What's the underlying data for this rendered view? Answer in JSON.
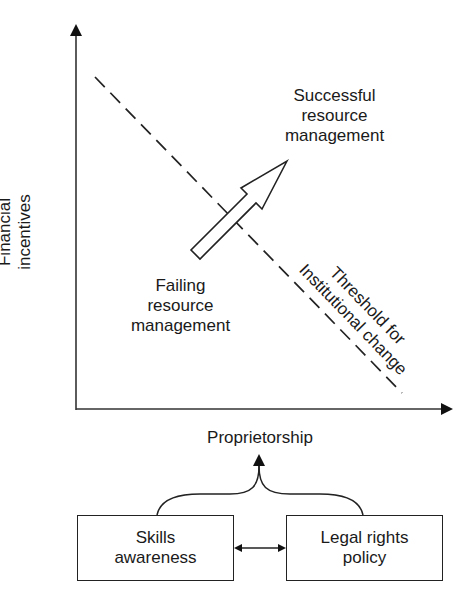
{
  "figure": {
    "y_axis_label": [
      "Financial",
      "incentives"
    ],
    "x_axis_label": "Proprietorship",
    "regions": {
      "upper": [
        "Successful",
        "resource",
        "management"
      ],
      "lower": [
        "Failing",
        "resource",
        "management"
      ]
    },
    "threshold_label": [
      "Threshold for",
      "Institutional change"
    ],
    "boxes": {
      "left": [
        "Skills",
        "awareness"
      ],
      "right": [
        "Legal rights",
        "policy"
      ]
    }
  },
  "colors": {
    "line": "#222222",
    "background": "#ffffff"
  }
}
